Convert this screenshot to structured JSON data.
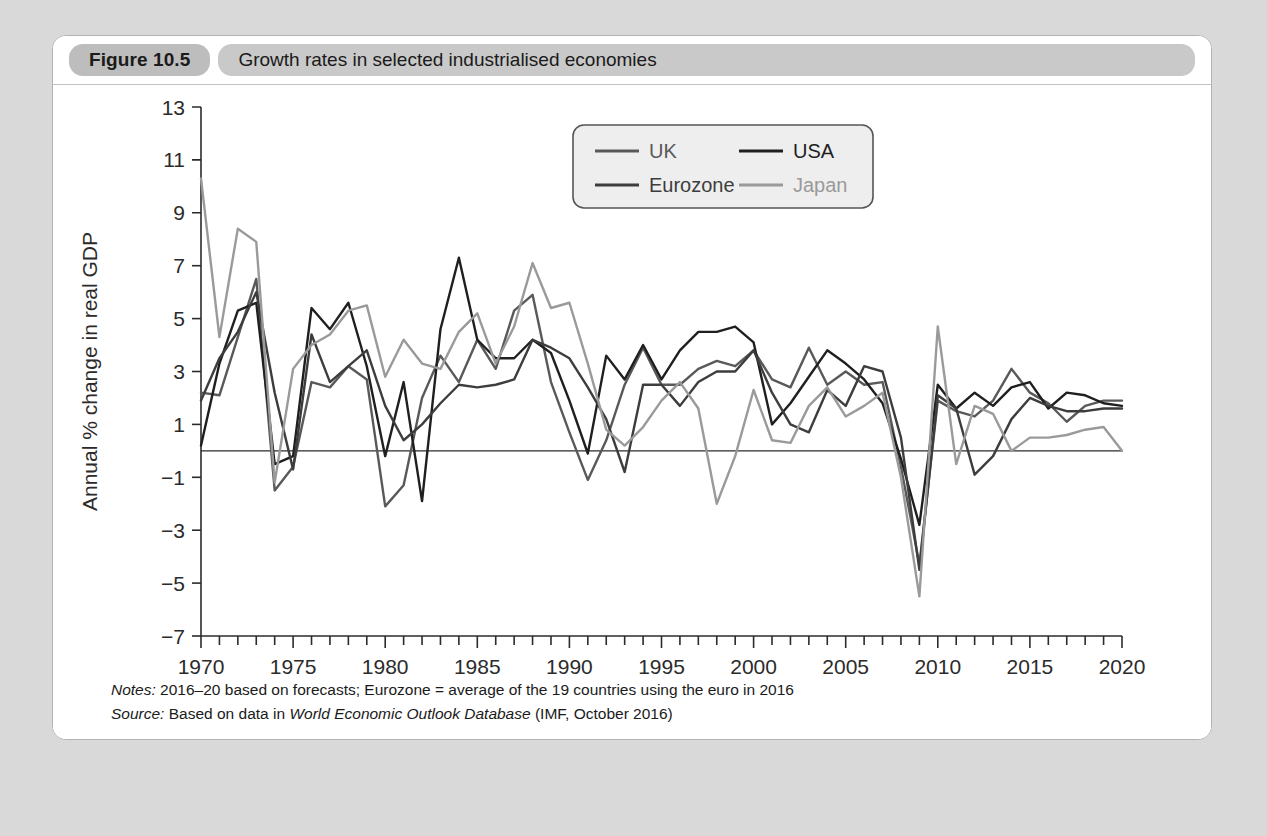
{
  "figure": {
    "number": "Figure 10.5",
    "title": "Growth rates in selected industrialised economies"
  },
  "notes": {
    "notes_lead": "Notes:",
    "notes_text": " 2016–20 based on forecasts; Eurozone = average of the 19 countries using the euro in 2016",
    "source_lead": "Source:",
    "source_text_pre": " Based on data in ",
    "source_em": "World Economic Outlook Database",
    "source_text_post": " (IMF, October 2016)"
  },
  "chart_data": {
    "type": "line",
    "title": "Growth rates in selected industrialised economies",
    "xlabel": "",
    "ylabel": "Annual % change in real GDP",
    "xlim": [
      1970,
      2020
    ],
    "ylim": [
      -7,
      13
    ],
    "ytick_step": 2,
    "yticks": [
      -7,
      -5,
      -3,
      -1,
      1,
      3,
      5,
      7,
      9,
      11,
      13
    ],
    "ytick_labels": [
      "−7",
      "−5",
      "−3",
      "−1",
      "1",
      "3",
      "5",
      "7",
      "9",
      "11",
      "13"
    ],
    "xticks": [
      1970,
      1975,
      1980,
      1985,
      1990,
      1995,
      2000,
      2005,
      2010,
      2015,
      2020
    ],
    "xtick_labels": [
      "1970",
      "1975",
      "1980",
      "1985",
      "1990",
      "1995",
      "2000",
      "2005",
      "2010",
      "2015",
      "2020"
    ],
    "minor_xtick_step": 1,
    "grid": false,
    "zero_line": true,
    "legend_position": "top-center",
    "x": [
      1970,
      1971,
      1972,
      1973,
      1974,
      1975,
      1976,
      1977,
      1978,
      1979,
      1980,
      1981,
      1982,
      1983,
      1984,
      1985,
      1986,
      1987,
      1988,
      1989,
      1990,
      1991,
      1992,
      1993,
      1994,
      1995,
      1996,
      1997,
      1998,
      1999,
      2000,
      2001,
      2002,
      2003,
      2004,
      2005,
      2006,
      2007,
      2008,
      2009,
      2010,
      2011,
      2012,
      2013,
      2014,
      2015,
      2016,
      2017,
      2018,
      2019,
      2020
    ],
    "series": [
      {
        "name": "UK",
        "color": "#595959",
        "values": [
          2.2,
          2.1,
          4.3,
          6.5,
          -1.5,
          -0.6,
          2.6,
          2.4,
          3.2,
          2.7,
          -2.1,
          -1.3,
          2.0,
          3.6,
          2.6,
          4.2,
          3.1,
          5.3,
          5.9,
          2.6,
          0.7,
          -1.1,
          0.4,
          2.5,
          3.9,
          2.5,
          2.5,
          3.1,
          3.4,
          3.2,
          3.8,
          2.7,
          2.4,
          3.9,
          2.5,
          3.0,
          2.5,
          2.6,
          -0.6,
          -4.3,
          1.9,
          1.5,
          1.3,
          1.9,
          3.1,
          2.2,
          1.8,
          1.1,
          1.7,
          1.9,
          1.9
        ]
      },
      {
        "name": "USA",
        "color": "#1f1f1f",
        "values": [
          0.2,
          3.3,
          5.3,
          5.6,
          -0.5,
          -0.2,
          5.4,
          4.6,
          5.6,
          3.2,
          -0.2,
          2.6,
          -1.9,
          4.6,
          7.3,
          4.2,
          3.5,
          3.5,
          4.2,
          3.7,
          1.9,
          -0.1,
          3.6,
          2.7,
          4.0,
          2.7,
          3.8,
          4.5,
          4.5,
          4.7,
          4.1,
          1.0,
          1.8,
          2.8,
          3.8,
          3.3,
          2.7,
          1.8,
          -0.3,
          -2.8,
          2.5,
          1.6,
          2.2,
          1.7,
          2.4,
          2.6,
          1.6,
          2.2,
          2.1,
          1.8,
          1.7
        ]
      },
      {
        "name": "Eurozone",
        "color": "#3d3d3d",
        "values": [
          1.9,
          3.5,
          4.5,
          6.0,
          2.2,
          -0.7,
          4.4,
          2.6,
          3.2,
          3.8,
          1.7,
          0.4,
          1.0,
          1.8,
          2.5,
          2.4,
          2.5,
          2.7,
          4.2,
          3.9,
          3.5,
          2.4,
          1.2,
          -0.8,
          2.5,
          2.5,
          1.7,
          2.6,
          3.0,
          3.0,
          3.8,
          2.2,
          1.0,
          0.7,
          2.3,
          1.7,
          3.2,
          3.0,
          0.5,
          -4.5,
          2.1,
          1.6,
          -0.9,
          -0.2,
          1.2,
          2.0,
          1.7,
          1.5,
          1.5,
          1.6,
          1.6
        ]
      },
      {
        "name": "Japan",
        "color": "#9a9a9a",
        "values": [
          10.3,
          4.3,
          8.4,
          7.9,
          -1.2,
          3.1,
          4.0,
          4.4,
          5.3,
          5.5,
          2.8,
          4.2,
          3.3,
          3.1,
          4.5,
          5.2,
          3.3,
          4.7,
          7.1,
          5.4,
          5.6,
          3.3,
          0.8,
          0.2,
          0.9,
          1.9,
          2.6,
          1.6,
          -2.0,
          -0.2,
          2.3,
          0.4,
          0.3,
          1.7,
          2.4,
          1.3,
          1.7,
          2.2,
          -1.0,
          -5.5,
          4.7,
          -0.5,
          1.7,
          1.4,
          0.0,
          0.5,
          0.5,
          0.6,
          0.8,
          0.9,
          0.0
        ]
      }
    ]
  }
}
